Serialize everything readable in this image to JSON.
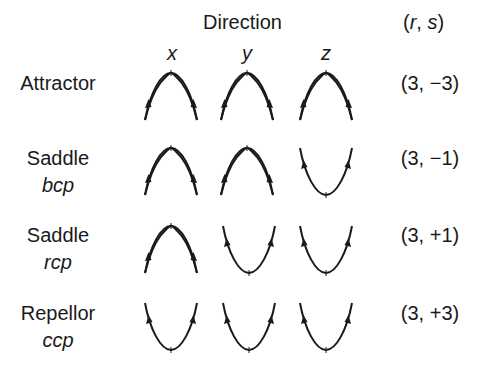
{
  "header": {
    "direction_label": "Direction",
    "rs_open": "(",
    "rs_r": "r",
    "rs_sep": ", ",
    "rs_s": "s",
    "rs_close": ")",
    "axes": [
      "x",
      "y",
      "z"
    ]
  },
  "rows": [
    {
      "name": "Attractor",
      "sub": "",
      "rs": "(3, −3)",
      "curves": [
        "max",
        "max",
        "max"
      ]
    },
    {
      "name": "Saddle",
      "sub": "bcp",
      "rs": "(3, −1)",
      "curves": [
        "max",
        "max",
        "min"
      ]
    },
    {
      "name": "Saddle",
      "sub": "rcp",
      "rs": "(3, +1)",
      "curves": [
        "max",
        "min",
        "min"
      ]
    },
    {
      "name": "Repellor",
      "sub": "ccp",
      "rs": "(3, +3)",
      "curves": [
        "min",
        "min",
        "min"
      ]
    }
  ],
  "legend": {
    "max": "downward-opening arch, arrows pointing up toward peak",
    "min": "upward-opening U, arrows pointing up away from minimum"
  }
}
